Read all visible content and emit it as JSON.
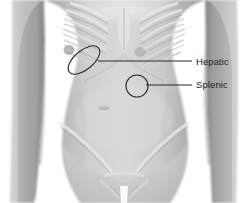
{
  "figure": {
    "type": "anatomical-illustration",
    "width": 249,
    "height": 203,
    "background_color": "#ffffff",
    "style": "grayscale shaded medical drawing"
  },
  "annotations": [
    {
      "id": "hepatic",
      "label": "Hepatic",
      "marker_shape": "ellipse",
      "marker": {
        "cx": 84,
        "cy": 60,
        "rx": 19,
        "ry": 9.5,
        "rotation": -40
      },
      "leader_line": {
        "x1": 98,
        "y1": 61,
        "x2": 192,
        "y2": 61
      },
      "label_position": {
        "x": 196,
        "y": 56
      },
      "stroke_color": "#2b2b2b"
    },
    {
      "id": "splenic",
      "label": "Splenic",
      "marker_shape": "circle",
      "marker": {
        "cx": 137,
        "cy": 86,
        "r": 11
      },
      "leader_line": {
        "x1": 146,
        "y1": 85,
        "x2": 192,
        "y2": 85
      },
      "label_position": {
        "x": 196,
        "y": 79
      },
      "stroke_color": "#2b2b2b"
    }
  ],
  "palette": {
    "skin_light": "#d8d8d8",
    "skin_mid": "#bdbdbd",
    "skin_shadow": "#9a9a9a",
    "skin_deep_shadow": "#828282",
    "bone_light": "#e6e6e6",
    "bone_edge": "#c9c9c9",
    "line_color": "#2b2b2b",
    "text_color": "#1d1d1d",
    "background": "#ffffff"
  },
  "body_parts": [
    {
      "name": "left-arm",
      "side": "viewer-left"
    },
    {
      "name": "right-arm",
      "side": "viewer-right"
    },
    {
      "name": "rib-cage"
    },
    {
      "name": "sternum"
    },
    {
      "name": "costal-margin"
    },
    {
      "name": "abdomen"
    },
    {
      "name": "umbilicus"
    },
    {
      "name": "iliac-crest-left"
    },
    {
      "name": "iliac-crest-right"
    },
    {
      "name": "pubic-symphysis"
    },
    {
      "name": "nipple-left"
    },
    {
      "name": "nipple-right"
    }
  ]
}
